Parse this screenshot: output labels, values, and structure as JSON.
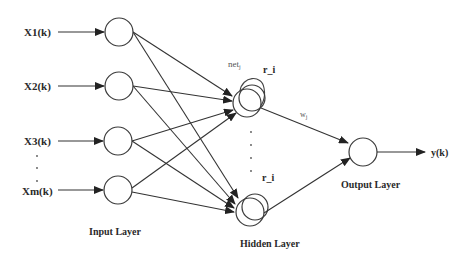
{
  "diagram": {
    "type": "neural-network",
    "inputs": [
      {
        "label": "X1(k)",
        "y": 32
      },
      {
        "label": "X2(k)",
        "y": 86
      },
      {
        "label": "X3(k)",
        "y": 141
      },
      {
        "label": "Xm(k)",
        "y": 191
      }
    ],
    "input_ellipsis": ".",
    "layers": {
      "input": "Input Layer",
      "hidden": "Hidden Layer",
      "output": "Output Layer"
    },
    "hidden_labels": {
      "net": "net",
      "net_sub": "j",
      "recurrent_top": "r_i",
      "recurrent_bottom": "r_i",
      "ellipsis": "."
    },
    "weight_label": "w",
    "weight_sub": "j",
    "output_label": "y(k)"
  }
}
